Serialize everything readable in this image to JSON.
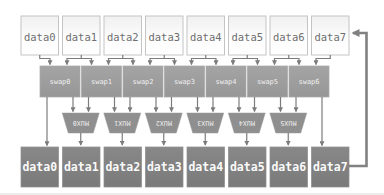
{
  "rows": {
    "top": [
      "data0",
      "data1",
      "data2",
      "data3",
      "data4",
      "data5",
      "data6",
      "data7"
    ],
    "swap": [
      "swap0",
      "swap1",
      "swap2",
      "swap3",
      "swap4",
      "swap5",
      "swap6"
    ],
    "mux": [
      "MUX0",
      "MUX1",
      "MUX2",
      "MUX3",
      "MUX4",
      "MUX5"
    ],
    "bottom": [
      "data0",
      "data1",
      "data2",
      "data3",
      "data4",
      "data5",
      "data6",
      "data7"
    ]
  },
  "notes": {
    "mux_label_orientation": "rotated-180"
  },
  "colors": {
    "top_box_fill": "#f9f9f9",
    "top_box_border": "#c4c4c4",
    "top_text": "#6e6e6e",
    "swap_box_fill": "#9d9d9d",
    "mux_fill": "#8f8f8f",
    "bottom_box_fill": "#7f7f7f",
    "light_text": "#f2f2f2",
    "arrow": "#7c7c7c",
    "feedback_arrow": "#818181",
    "background": "#ffffff"
  }
}
